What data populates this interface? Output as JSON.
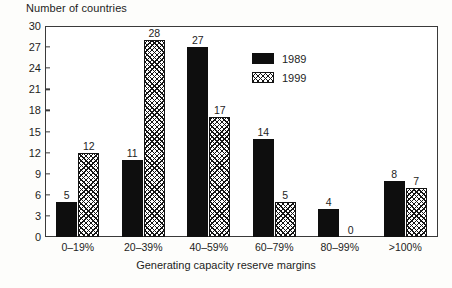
{
  "chart_data": {
    "type": "bar",
    "title": "",
    "ylabel": "Number of countries",
    "xlabel": "Generating capacity reserve margins",
    "categories": [
      "0–19%",
      "20–39%",
      "40–59%",
      "60–79%",
      "80–99%",
      ">100%"
    ],
    "series": [
      {
        "name": "1989",
        "values": [
          5,
          11,
          27,
          14,
          4,
          8
        ],
        "style": "solid-black",
        "color": "#0e0e0e"
      },
      {
        "name": "1999",
        "values": [
          12,
          28,
          17,
          5,
          0,
          7
        ],
        "style": "crosshatch",
        "color": "#141414"
      }
    ],
    "yticks": [
      0,
      3,
      6,
      9,
      12,
      15,
      18,
      21,
      24,
      27,
      30
    ],
    "ylim": [
      0,
      30
    ],
    "grid": false,
    "legend_position": "top-center-right",
    "value_labels": true
  },
  "legend": {
    "entries": [
      {
        "label": "1989",
        "swatch": "solid-black-swatch"
      },
      {
        "label": "1999",
        "swatch": "crosshatch-swatch"
      }
    ]
  }
}
